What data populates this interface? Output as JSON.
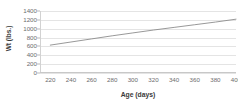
{
  "chart_data": {
    "type": "line",
    "title": "",
    "xlabel": "Age (days)",
    "ylabel": "Wt (lbs.)",
    "xlim": [
      210,
      400
    ],
    "ylim": [
      0,
      1400
    ],
    "xticks": [
      220,
      240,
      260,
      280,
      300,
      320,
      340,
      360,
      380,
      400
    ],
    "xtick_labels": [
      "220",
      "240",
      "260",
      "280",
      "300",
      "320",
      "340",
      "360",
      "380",
      "400"
    ],
    "yticks": [
      0,
      200,
      400,
      600,
      800,
      1000,
      1200,
      1400
    ],
    "ytick_labels": [
      "0",
      "200",
      "400",
      "600",
      "800",
      "1000",
      "1200",
      "1400"
    ],
    "grid": "horizontal",
    "legend": "none",
    "series": [
      {
        "name": "Weight",
        "color": "#8c8c8c",
        "x": [
          220,
          240,
          260,
          280,
          300,
          320,
          340,
          360,
          380,
          400
        ],
        "values": [
          630,
          700,
          770,
          840,
          905,
          970,
          1030,
          1090,
          1150,
          1215
        ]
      }
    ]
  },
  "axes": {
    "x_title": "Age (days)",
    "y_title": "Wt (lbs.)"
  },
  "colors": {
    "series_line": "#8c8c8c",
    "gridline": "#e4e4e4",
    "axis": "#c8c8c8",
    "tick_text": "#6d6d6d",
    "title_text": "#3a3a3a",
    "background": "#ffffff"
  }
}
